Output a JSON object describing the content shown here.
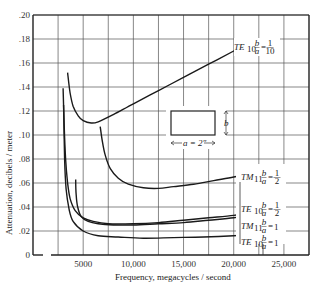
{
  "chart_data": {
    "type": "line",
    "title": "",
    "xlabel": "Frequency, megacycles / second",
    "ylabel": "Attenuation, decibels / meter",
    "xlim": [
      0,
      27500
    ],
    "ylim": [
      0,
      0.2
    ],
    "grid": true,
    "x_ticks": [
      {
        "value": 5000,
        "label": "5000"
      },
      {
        "value": 10000,
        "label": "10,000"
      },
      {
        "value": 15000,
        "label": "15,000"
      },
      {
        "value": 20000,
        "label": "20,000"
      },
      {
        "value": 25000,
        "label": "25,000"
      }
    ],
    "y_ticks": [
      {
        "value": 0,
        "label": "0"
      },
      {
        "value": 0.02,
        "label": ".02"
      },
      {
        "value": 0.04,
        "label": ".04"
      },
      {
        "value": 0.06,
        "label": ".06"
      },
      {
        "value": 0.08,
        "label": ".08"
      },
      {
        "value": 0.1,
        "label": ".10"
      },
      {
        "value": 0.12,
        "label": ".12"
      },
      {
        "value": 0.14,
        "label": ".14"
      },
      {
        "value": 0.16,
        "label": ".16"
      },
      {
        "value": 0.18,
        "label": ".18"
      },
      {
        "value": 0.2,
        "label": ".20"
      }
    ],
    "series": [
      {
        "name": "TE10 b/a = 1/10",
        "mode": "TE",
        "sub": "10",
        "ratio_num": "1",
        "ratio_den": "10",
        "points": [
          [
            3450,
            0.152
          ],
          [
            3700,
            0.135
          ],
          [
            4000,
            0.124
          ],
          [
            4500,
            0.116
          ],
          [
            5000,
            0.112
          ],
          [
            5800,
            0.11
          ],
          [
            6500,
            0.111
          ],
          [
            8000,
            0.117
          ],
          [
            10000,
            0.126
          ],
          [
            12500,
            0.137
          ],
          [
            15000,
            0.148
          ],
          [
            17500,
            0.159
          ],
          [
            20000,
            0.17
          ],
          [
            21800,
            0.178
          ]
        ]
      },
      {
        "name": "TM11 b/a = 1/2",
        "mode": "TM",
        "sub": "11",
        "ratio_num": "1",
        "ratio_den": "2",
        "points": [
          [
            6700,
            0.107
          ],
          [
            6900,
            0.095
          ],
          [
            7200,
            0.083
          ],
          [
            7700,
            0.072
          ],
          [
            8500,
            0.064
          ],
          [
            9500,
            0.059
          ],
          [
            11000,
            0.056
          ],
          [
            12500,
            0.0555
          ],
          [
            14000,
            0.057
          ],
          [
            16000,
            0.059
          ],
          [
            18000,
            0.062
          ],
          [
            20000,
            0.065
          ],
          [
            21800,
            0.068
          ]
        ]
      },
      {
        "name": "TE10 b/a = 1/2",
        "mode": "TE",
        "sub": "10",
        "ratio_num": "1",
        "ratio_den": "2",
        "points": [
          [
            3000,
            0.139
          ],
          [
            3100,
            0.11
          ],
          [
            3250,
            0.08
          ],
          [
            3450,
            0.06
          ],
          [
            3700,
            0.047
          ],
          [
            4200,
            0.037
          ],
          [
            5000,
            0.031
          ],
          [
            6000,
            0.028
          ],
          [
            7500,
            0.026
          ],
          [
            10000,
            0.026
          ],
          [
            12500,
            0.027
          ],
          [
            15000,
            0.029
          ],
          [
            17500,
            0.031
          ],
          [
            20000,
            0.033
          ],
          [
            21800,
            0.036
          ]
        ]
      },
      {
        "name": "TM11 b/a = 1",
        "mode": "TM",
        "sub": "11",
        "ratio_num": "b",
        "ratio_den": "a",
        "ratio_val": "1",
        "points": [
          [
            4250,
            0.063
          ],
          [
            4300,
            0.05
          ],
          [
            4450,
            0.04
          ],
          [
            4800,
            0.032
          ],
          [
            5500,
            0.028
          ],
          [
            6500,
            0.026
          ],
          [
            8000,
            0.025
          ],
          [
            10000,
            0.025
          ],
          [
            12500,
            0.026
          ],
          [
            15000,
            0.027
          ],
          [
            17500,
            0.029
          ],
          [
            20000,
            0.031
          ],
          [
            21800,
            0.034
          ]
        ]
      },
      {
        "name": "TE10 b/a = 1",
        "mode": "TE",
        "sub": "10",
        "ratio_num": "b",
        "ratio_den": "a",
        "ratio_val": "1",
        "points": [
          [
            3050,
            0.125
          ],
          [
            3150,
            0.08
          ],
          [
            3300,
            0.055
          ],
          [
            3600,
            0.038
          ],
          [
            4000,
            0.028
          ],
          [
            5000,
            0.02
          ],
          [
            6500,
            0.016
          ],
          [
            8500,
            0.015
          ],
          [
            11000,
            0.014
          ],
          [
            14000,
            0.0145
          ],
          [
            17000,
            0.015
          ],
          [
            20000,
            0.016
          ],
          [
            21800,
            0.017
          ]
        ]
      }
    ],
    "annotations": [
      {
        "text": "TE10 b/a = 1/10"
      },
      {
        "text": "TM11 b/a = 1/2"
      },
      {
        "text": "TE10 b/a = 1/2"
      },
      {
        "text": "TM11 b/a = 1"
      },
      {
        "text": "TE10 b/a = 1"
      },
      {
        "text": "a = 2\""
      },
      {
        "text": "b"
      }
    ]
  },
  "labels": {
    "xlabel": "Frequency, megacycles / second",
    "ylabel": "Attenuation, decibels / meter",
    "inset_a": "a = 2″",
    "inset_b": "b"
  }
}
